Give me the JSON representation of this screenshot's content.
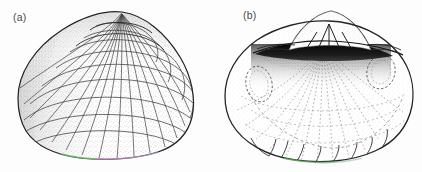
{
  "figure": {
    "background_color": "#fdfdfd",
    "ink_color": "#2b2b2b",
    "stipple_color": "#555555",
    "ligament_color": "#0a0a0a",
    "margin_tint_green": "#6ec46e",
    "margin_tint_magenta": "#c489c4",
    "panels": [
      {
        "id": "a",
        "label": "(a)",
        "view": "exterior right valve",
        "features": [
          "umbo",
          "radial ribs",
          "commarginal growth lines",
          "cancellate sculpture",
          "ventral margin"
        ]
      },
      {
        "id": "b",
        "label": "(b)",
        "view": "interior right valve",
        "features": [
          "hinge plate",
          "cardinal teeth",
          "ligament",
          "anterior adductor muscle scar",
          "posterior adductor muscle scar",
          "radial interior striae",
          "crenulate ventral margin"
        ]
      }
    ]
  }
}
